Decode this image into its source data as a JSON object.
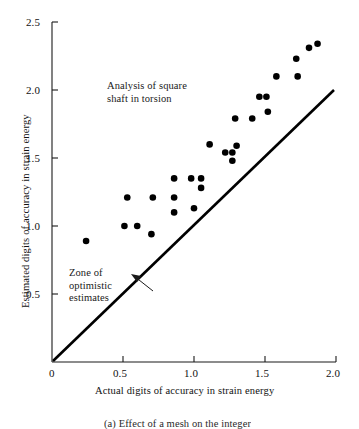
{
  "chart_data": {
    "type": "scatter",
    "title": "",
    "xlabel": "Actual digits of accuracy in strain energy",
    "ylabel": "Estimated digits of accuracy in strain energy",
    "xlim": [
      0,
      2.0
    ],
    "ylim": [
      0,
      2.5
    ],
    "xticks": [
      0,
      0.5,
      1.0,
      1.5,
      2.0
    ],
    "xtick_labels": [
      "0",
      "0.5",
      "1.0",
      "1.5",
      "2.0"
    ],
    "yticks": [
      0.5,
      1.0,
      1.5,
      2.0,
      2.5
    ],
    "ytick_labels": [
      "0.5",
      "1.0",
      "1.5",
      "2.0",
      "2.5"
    ],
    "grid": false,
    "legend": "none",
    "series": [
      {
        "name": "Analysis of square shaft in torsion",
        "marker": "filled-circle",
        "color": "#000000",
        "points": [
          [
            0.24,
            0.89
          ],
          [
            0.51,
            1.0
          ],
          [
            0.53,
            1.21
          ],
          [
            0.6,
            1.0
          ],
          [
            0.7,
            0.94
          ],
          [
            0.71,
            1.21
          ],
          [
            0.86,
            1.35
          ],
          [
            0.86,
            1.21
          ],
          [
            0.86,
            1.1
          ],
          [
            0.98,
            1.35
          ],
          [
            1.05,
            1.35
          ],
          [
            1.0,
            1.13
          ],
          [
            1.05,
            1.28
          ],
          [
            1.11,
            1.6
          ],
          [
            1.22,
            1.54
          ],
          [
            1.27,
            1.54
          ],
          [
            1.27,
            1.48
          ],
          [
            1.3,
            1.59
          ],
          [
            1.29,
            1.79
          ],
          [
            1.41,
            1.79
          ],
          [
            1.46,
            1.95
          ],
          [
            1.51,
            1.95
          ],
          [
            1.52,
            1.84
          ],
          [
            1.58,
            2.1
          ],
          [
            1.72,
            2.23
          ],
          [
            1.73,
            2.1
          ],
          [
            1.81,
            2.31
          ],
          [
            1.87,
            2.34
          ]
        ]
      }
    ],
    "reference_line": {
      "name": "y = x identity line",
      "from": [
        0,
        0
      ],
      "to": [
        2.0,
        2.0
      ],
      "color": "#000000"
    },
    "annotations": [
      {
        "name": "series-title",
        "text": "Analysis of square\nshaft in torsion",
        "x": 0.38,
        "y": 2.12
      },
      {
        "name": "zone-label",
        "text": "Zone of\noptimistic\nestimates",
        "x": 0.12,
        "y": 0.83
      }
    ],
    "arrow": {
      "name": "zone-pointer-arrow",
      "from": [
        0.71,
        0.53
      ],
      "to": [
        0.57,
        0.64
      ]
    }
  },
  "figure": {
    "caption_partial": "(a)  Effect of a mesh on the integer"
  }
}
